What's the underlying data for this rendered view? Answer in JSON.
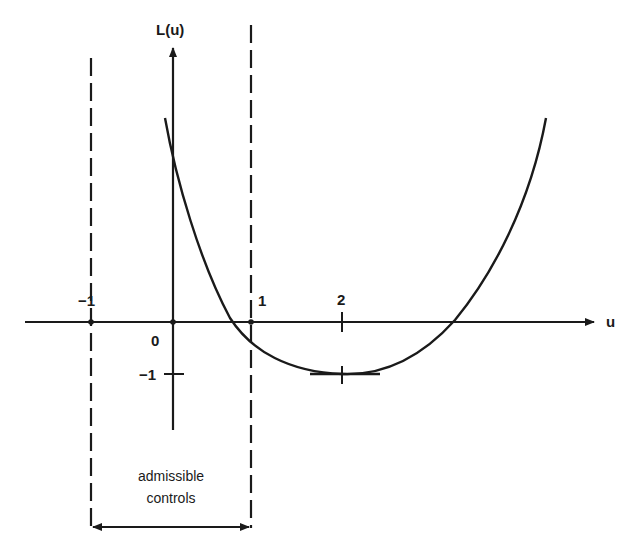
{
  "diagram": {
    "y_axis_label": "L(u)",
    "x_axis_label": "u",
    "ticks": {
      "x_neg1": "−1",
      "x_0": "0",
      "x_1": "1",
      "x_2": "2",
      "y_neg1": "−1"
    },
    "region_caption_line1": "admissible",
    "region_caption_line2": "controls",
    "admissible_range": [
      -1,
      1
    ],
    "curve": {
      "type": "parabola",
      "minimum": {
        "u": 2,
        "L": -1
      },
      "L_at_0": 1.7,
      "zero_crossings": [
        0.7,
        3.3
      ]
    },
    "colors": {
      "ink": "#1a1a1a",
      "background": "#ffffff"
    }
  }
}
